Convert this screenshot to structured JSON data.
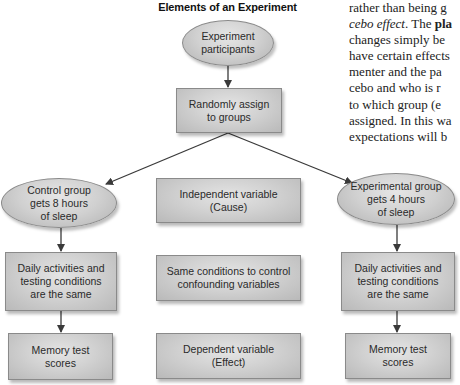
{
  "diagram": {
    "title": "Elements of an Experiment",
    "nodes": {
      "participants": {
        "line1": "Experiment",
        "line2": "participants",
        "shape": "oval"
      },
      "assign": {
        "line1": "Randomly assign",
        "line2": "to groups",
        "shape": "box"
      },
      "control_group": {
        "line1": "Control group",
        "line2": "gets 8 hours",
        "line3": "of sleep",
        "shape": "oval"
      },
      "experimental_group": {
        "line1": "Experimental group",
        "line2": "gets 4 hours",
        "line3": "of sleep",
        "shape": "oval"
      },
      "independent_variable": {
        "line1": "Independent variable",
        "line2": "(Cause)",
        "shape": "box"
      },
      "confounding": {
        "line1": "Same conditions to control",
        "line2": "confounding variables",
        "shape": "box"
      },
      "dependent_variable": {
        "line1": "Dependent variable",
        "line2": "(Effect)",
        "shape": "box"
      },
      "control_daily": {
        "line1": "Daily activities and",
        "line2": "testing conditions",
        "line3": "are the same",
        "shape": "box"
      },
      "experimental_daily": {
        "line1": "Daily activities and",
        "line2": "testing conditions",
        "line3": "are the same",
        "shape": "box"
      },
      "control_scores": {
        "line1": "Memory test",
        "line2": "scores",
        "shape": "box"
      },
      "experimental_scores": {
        "line1": "Memory test",
        "line2": "scores",
        "shape": "box"
      }
    },
    "edges": [
      {
        "from": "participants",
        "to": "assign"
      },
      {
        "from": "assign",
        "to": "control_group"
      },
      {
        "from": "assign",
        "to": "experimental_group"
      },
      {
        "from": "control_group",
        "to": "control_daily"
      },
      {
        "from": "control_daily",
        "to": "control_scores"
      },
      {
        "from": "experimental_group",
        "to": "experimental_daily"
      },
      {
        "from": "experimental_daily",
        "to": "experimental_scores"
      }
    ],
    "colors": {
      "arrow": "#3a3a3a",
      "border": "#8a8a8a",
      "fill_light": "#e4e4e4",
      "fill_dark": "#b9b9b9"
    }
  },
  "body_text": {
    "lines": [
      {
        "pre": "rather than being g",
        "em": "",
        "b": "",
        "post": ""
      },
      {
        "pre": "",
        "em": "cebo effect",
        "mid": ". The ",
        "b": "pla",
        "post": ""
      },
      {
        "pre": "changes simply be",
        "em": "",
        "b": "",
        "post": ""
      },
      {
        "pre": "have certain effects",
        "em": "",
        "b": "",
        "post": ""
      },
      {
        "pre": "menter and the pa",
        "em": "",
        "b": "",
        "post": ""
      },
      {
        "pre": "cebo and who is r",
        "em": "",
        "b": "",
        "post": ""
      },
      {
        "pre": "to which group (e",
        "em": "",
        "b": "",
        "post": ""
      },
      {
        "pre": "assigned. In this wa",
        "em": "",
        "b": "",
        "post": ""
      },
      {
        "pre": "expectations will b",
        "em": "",
        "b": "",
        "post": ""
      }
    ]
  }
}
